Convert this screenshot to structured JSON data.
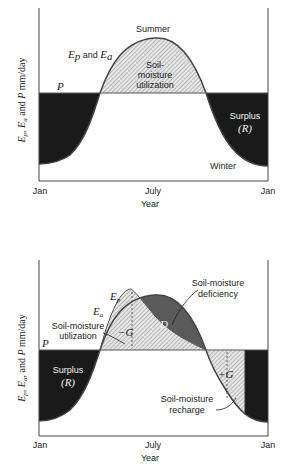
{
  "colors": {
    "surplus": "#1a1a1a",
    "deficiency": "#5a5a5a",
    "hatch_bg": "#e6e6e6",
    "hatch_line": "#8a8a8a",
    "axis": "#444444"
  },
  "top_diagram": {
    "ylabel": "Ep, Ea and P mm/day",
    "xlabel": "Year",
    "x_ticks": [
      "Jan",
      "July",
      "Jan"
    ],
    "curve_label": "Ep and Ea",
    "p_label": "P",
    "summer_label": "Summer",
    "winter_label": "Winter",
    "utilization_label": [
      "Soil-",
      "moisture",
      "utilization"
    ],
    "surplus_label": [
      "Surplus",
      "(R)"
    ]
  },
  "bottom_diagram": {
    "ylabel": "Ep, Ea, and P mm/day",
    "xlabel": "Year",
    "x_ticks": [
      "Jan",
      "July",
      "Jan"
    ],
    "ep_label": "Ep",
    "ea_label": "Ea",
    "p_label": "P",
    "deficiency_label": [
      "Soil-moisture",
      "deficiency"
    ],
    "d_label": "D",
    "utilization_label": [
      "Soil-moisture",
      "utilization"
    ],
    "minus_g_label": "−G",
    "plus_g_label": "+G",
    "recharge_label": [
      "Soil-moisture",
      "recharge"
    ],
    "surplus_label": [
      "Surplus",
      "(R)"
    ]
  }
}
